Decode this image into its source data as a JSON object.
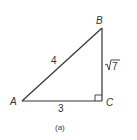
{
  "figure": {
    "caption": "(a)",
    "stroke_color": "#333333",
    "vertices": {
      "A": {
        "label": "A",
        "x": 22,
        "y": 101
      },
      "B": {
        "label": "B",
        "x": 102,
        "y": 28
      },
      "C": {
        "label": "C",
        "x": 102,
        "y": 101
      }
    },
    "sides": {
      "AB": "4",
      "BC_radicand": "7",
      "AC": "3"
    },
    "right_angle_at": "C"
  }
}
